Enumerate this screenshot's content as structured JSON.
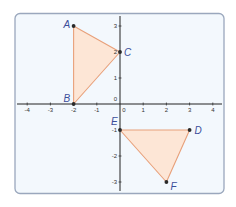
{
  "diagram": {
    "type": "coordinate-plane",
    "colors": {
      "frame_border": "#9aa7bd",
      "frame_fill": "#f3f8fd",
      "axis": "#222222",
      "triangle_stroke": "#e8a07a",
      "triangle_fill": "#fde6d6",
      "point": "#2a2a2a",
      "label": "#3b4e9a"
    },
    "x_axis": {
      "min": -4,
      "max": 4,
      "tick_labels": [
        "-4",
        "-3",
        "-2",
        "-1",
        "0",
        "1",
        "2",
        "3",
        "4"
      ]
    },
    "y_axis": {
      "min": -3,
      "max": 3,
      "tick_labels": [
        "3",
        "2",
        "1",
        "0",
        "-1",
        "-2",
        "-3"
      ]
    },
    "points": [
      {
        "name": "A",
        "x": -2,
        "y": 3
      },
      {
        "name": "B",
        "x": -2,
        "y": 0
      },
      {
        "name": "C",
        "x": 0,
        "y": 2
      },
      {
        "name": "D",
        "x": 3,
        "y": -1
      },
      {
        "name": "E",
        "x": 0,
        "y": -1
      },
      {
        "name": "F",
        "x": 2,
        "y": -3
      }
    ],
    "triangles": [
      {
        "name": "ABC",
        "vertices": [
          "A",
          "B",
          "C"
        ]
      },
      {
        "name": "DEF",
        "vertices": [
          "D",
          "E",
          "F"
        ]
      }
    ]
  }
}
